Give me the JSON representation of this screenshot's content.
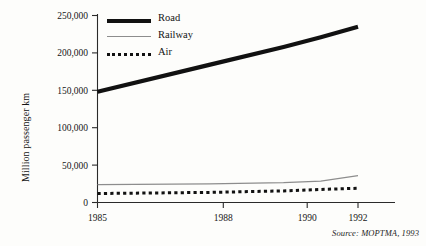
{
  "chart_data": {
    "type": "line",
    "title": "",
    "xlabel": "",
    "ylabel": "Million passenger km",
    "x": [
      1985,
      1988,
      1990,
      1991,
      1992
    ],
    "xlim": [
      1985,
      1992
    ],
    "ylim": [
      0,
      250000
    ],
    "x_ticks": [
      1985,
      1988,
      1990,
      1992
    ],
    "x_tick_labels": [
      "1985",
      "1988",
      "1990",
      "1992"
    ],
    "y_ticks": [
      0,
      50000,
      100000,
      150000,
      200000,
      250000
    ],
    "y_tick_labels": [
      "0",
      "50,000",
      "100,000",
      "150,000",
      "200,000",
      "250,000"
    ],
    "grid": false,
    "legend_position": "top-left",
    "series": [
      {
        "name": "Road",
        "style": "thick-solid",
        "color": "#111111",
        "values": [
          148000,
          184000,
          208000,
          221000,
          235000
        ]
      },
      {
        "name": "Railway",
        "style": "thin-solid",
        "color": "#8d8d8d",
        "values": [
          24000,
          25000,
          26500,
          28500,
          36000
        ]
      },
      {
        "name": "Air",
        "style": "dotted",
        "color": "#111111",
        "values": [
          12000,
          13500,
          15500,
          17500,
          19000
        ]
      }
    ],
    "annotations": [
      {
        "name": "source",
        "text": "Source: MOPTMA, 1993"
      }
    ]
  },
  "axis_title": "Million passenger km",
  "source_note": "Source: MOPTMA, 1993",
  "legend": {
    "items": [
      {
        "label": "Road"
      },
      {
        "label": "Railway"
      },
      {
        "label": "Air"
      }
    ]
  },
  "colors": {
    "road": "#111111",
    "railway": "#8d8d8d",
    "air": "#111111",
    "axis": "#2a2a2a",
    "background": "#fdfdfb"
  }
}
